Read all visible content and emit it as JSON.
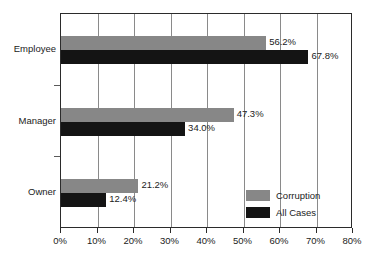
{
  "chart_data": {
    "type": "bar",
    "orientation": "horizontal",
    "title": "",
    "xlabel": "",
    "ylabel": "",
    "categories": [
      "Employee",
      "Manager",
      "Owner"
    ],
    "series": [
      {
        "name": "Corruption",
        "color": "#878787",
        "values": [
          56.2,
          47.3,
          21.2
        ],
        "labels": [
          "56.2%",
          "47.3%",
          "21.2%"
        ]
      },
      {
        "name": "All Cases",
        "color": "#141414",
        "values": [
          67.8,
          34.0,
          12.4
        ],
        "labels": [
          "67.8%",
          "34.0%",
          "12.4%"
        ]
      }
    ],
    "xlim": [
      0,
      80
    ],
    "xticks": [
      0,
      10,
      20,
      30,
      40,
      50,
      60,
      70,
      80
    ],
    "xtick_labels": [
      "0%",
      "10%",
      "20%",
      "30%",
      "40%",
      "50%",
      "60%",
      "70%",
      "80%"
    ],
    "grid": true,
    "grid_axis": "x",
    "legend_position": "lower right"
  },
  "legend": {
    "items": [
      {
        "label": "Corruption"
      },
      {
        "label": "All Cases"
      }
    ]
  }
}
